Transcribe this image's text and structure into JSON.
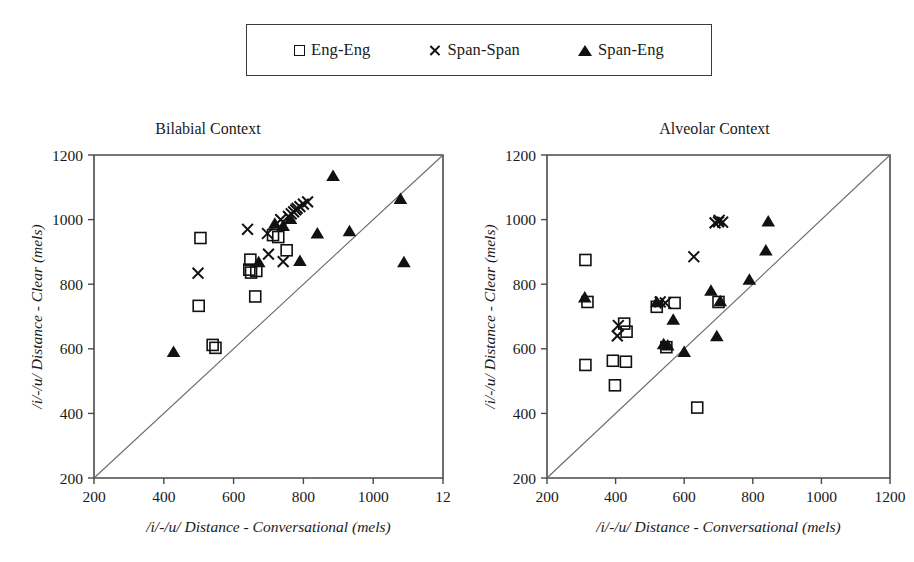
{
  "legend": {
    "entries": [
      {
        "marker": "square-icon",
        "label": "Eng-Eng"
      },
      {
        "marker": "cross-icon",
        "label": "Span-Span"
      },
      {
        "marker": "triangle-icon",
        "label": "Span-Eng"
      }
    ]
  },
  "chart_data": [
    {
      "type": "scatter",
      "title": "Bilabial Context",
      "xlabel": "/i/-/u/ Distance - Conversational (mels)",
      "ylabel": "/i/-/u/ Distance - Clear (mels)",
      "xlim": [
        200,
        1200
      ],
      "ylim": [
        200,
        1200
      ],
      "xticks": [
        200,
        400,
        600,
        800,
        1000,
        1200
      ],
      "xticklabels": [
        "200",
        "400",
        "600",
        "800",
        "1000",
        "12"
      ],
      "yticks": [
        200,
        400,
        600,
        800,
        1000,
        1200
      ],
      "yticklabels": [
        "200",
        "400",
        "600",
        "800",
        "1000",
        "1200"
      ],
      "grid": false,
      "legend_position": "top-outside",
      "annotations": [
        "diagonal reference line y = x"
      ],
      "series": [
        {
          "name": "Eng-Eng",
          "marker": "square",
          "points": [
            [
              505,
              943
            ],
            [
              500,
              733
            ],
            [
              540,
              612
            ],
            [
              548,
              603
            ],
            [
              648,
              876
            ],
            [
              645,
              845
            ],
            [
              650,
              836
            ],
            [
              665,
              841
            ],
            [
              662,
              762
            ],
            [
              713,
              952
            ],
            [
              728,
              946
            ],
            [
              752,
              905
            ]
          ]
        },
        {
          "name": "Span-Span",
          "marker": "cross",
          "points": [
            [
              498,
              834
            ],
            [
              640,
              970
            ],
            [
              697,
              957
            ],
            [
              700,
              893
            ],
            [
              742,
              870
            ],
            [
              757,
              1010
            ],
            [
              765,
              1018
            ],
            [
              772,
              1024
            ],
            [
              778,
              1030
            ],
            [
              782,
              1035
            ],
            [
              790,
              1040
            ],
            [
              800,
              1048
            ],
            [
              812,
              1055
            ],
            [
              735,
              1000
            ]
          ]
        },
        {
          "name": "Span-Eng",
          "marker": "triangle",
          "points": [
            [
              428,
              588
            ],
            [
              672,
              866
            ],
            [
              718,
              985
            ],
            [
              742,
              978
            ],
            [
              763,
              1000
            ],
            [
              790,
              870
            ],
            [
              840,
              955
            ],
            [
              885,
              1133
            ],
            [
              932,
              962
            ],
            [
              1078,
              1062
            ],
            [
              1088,
              866
            ]
          ]
        }
      ]
    },
    {
      "type": "scatter",
      "title": "Alveolar Context",
      "xlabel": "/i/-/u/ Distance - Conversational (mels)",
      "ylabel": "/i/-/u/ Distance - Clear (mels)",
      "xlim": [
        200,
        1200
      ],
      "ylim": [
        200,
        1200
      ],
      "xticks": [
        200,
        400,
        600,
        800,
        1000,
        1200
      ],
      "xticklabels": [
        "200",
        "400",
        "600",
        "800",
        "1000",
        "1200"
      ],
      "yticks": [
        200,
        400,
        600,
        800,
        1000,
        1200
      ],
      "yticklabels": [
        "200",
        "400",
        "600",
        "800",
        "1000",
        "1200"
      ],
      "grid": false,
      "legend_position": "top-outside",
      "annotations": [
        "diagonal reference line y = x"
      ],
      "series": [
        {
          "name": "Eng-Eng",
          "marker": "square",
          "points": [
            [
              312,
              875
            ],
            [
              318,
              745
            ],
            [
              312,
              550
            ],
            [
              398,
              487
            ],
            [
              392,
              563
            ],
            [
              430,
              560
            ],
            [
              425,
              678
            ],
            [
              432,
              653
            ],
            [
              520,
              730
            ],
            [
              548,
              605
            ],
            [
              572,
              742
            ],
            [
              700,
              745
            ],
            [
              638,
              418
            ]
          ]
        },
        {
          "name": "Span-Span",
          "marker": "cross",
          "points": [
            [
              405,
              640
            ],
            [
              408,
              672
            ],
            [
              530,
              745
            ],
            [
              545,
              742
            ],
            [
              628,
              885
            ],
            [
              690,
              990
            ],
            [
              700,
              993
            ],
            [
              702,
              998
            ],
            [
              712,
              992
            ]
          ]
        },
        {
          "name": "Span-Eng",
          "marker": "triangle",
          "points": [
            [
              310,
              757
            ],
            [
              520,
              742
            ],
            [
              540,
              612
            ],
            [
              552,
              608
            ],
            [
              568,
              688
            ],
            [
              600,
              588
            ],
            [
              678,
              778
            ],
            [
              695,
              637
            ],
            [
              790,
              812
            ],
            [
              838,
              902
            ],
            [
              845,
              992
            ],
            [
              705,
              745
            ]
          ]
        }
      ]
    }
  ]
}
